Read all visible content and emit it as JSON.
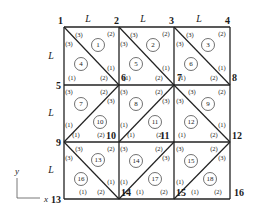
{
  "figure": {
    "grid": {
      "x0": 64,
      "y0": 27,
      "cols": [
        64,
        119,
        174,
        230
      ],
      "rows": [
        27,
        85,
        142,
        199
      ]
    },
    "nodes": [
      {
        "id": "1",
        "x": 64,
        "y": 27,
        "lx": 58,
        "ly": 24
      },
      {
        "id": "2",
        "x": 119,
        "y": 27,
        "lx": 114,
        "ly": 24
      },
      {
        "id": "3",
        "x": 174,
        "y": 27,
        "lx": 169,
        "ly": 24
      },
      {
        "id": "4",
        "x": 230,
        "y": 27,
        "lx": 225,
        "ly": 24
      },
      {
        "id": "5",
        "x": 64,
        "y": 85,
        "lx": 56,
        "ly": 89
      },
      {
        "id": "6",
        "x": 119,
        "y": 85,
        "lx": 121,
        "ly": 81
      },
      {
        "id": "7",
        "x": 174,
        "y": 85,
        "lx": 177,
        "ly": 81
      },
      {
        "id": "8",
        "x": 230,
        "y": 85,
        "lx": 232,
        "ly": 81
      },
      {
        "id": "9",
        "x": 64,
        "y": 142,
        "lx": 56,
        "ly": 146
      },
      {
        "id": "10",
        "x": 119,
        "y": 142,
        "lx": 106,
        "ly": 139
      },
      {
        "id": "11",
        "x": 174,
        "y": 142,
        "lx": 160,
        "ly": 139
      },
      {
        "id": "12",
        "x": 230,
        "y": 142,
        "lx": 232,
        "ly": 139
      },
      {
        "id": "13",
        "x": 64,
        "y": 199,
        "lx": 51,
        "ly": 203
      },
      {
        "id": "14",
        "x": 119,
        "y": 199,
        "lx": 121,
        "ly": 196
      },
      {
        "id": "15",
        "x": 174,
        "y": 199,
        "lx": 176,
        "ly": 196
      },
      {
        "id": "16",
        "x": 230,
        "y": 199,
        "lx": 234,
        "ly": 196
      }
    ],
    "dimension_labels": [
      {
        "text": "L",
        "x": 88,
        "y": 22
      },
      {
        "text": "L",
        "x": 143,
        "y": 22
      },
      {
        "text": "L",
        "x": 199,
        "y": 22
      },
      {
        "text": "L",
        "x": 51,
        "y": 59
      },
      {
        "text": "L",
        "x": 51,
        "y": 116
      },
      {
        "text": "L",
        "x": 51,
        "y": 173
      }
    ],
    "diagonals": [
      {
        "x1": 64,
        "y1": 27,
        "x2": 119,
        "y2": 85
      },
      {
        "x1": 119,
        "y1": 27,
        "x2": 174,
        "y2": 85
      },
      {
        "x1": 174,
        "y1": 27,
        "x2": 230,
        "y2": 85
      },
      {
        "x1": 64,
        "y1": 142,
        "x2": 119,
        "y2": 85
      },
      {
        "x1": 119,
        "y1": 142,
        "x2": 174,
        "y2": 85
      },
      {
        "x1": 174,
        "y1": 85,
        "x2": 230,
        "y2": 142
      },
      {
        "x1": 64,
        "y1": 142,
        "x2": 119,
        "y2": 199
      },
      {
        "x1": 119,
        "y1": 199,
        "x2": 174,
        "y2": 142
      },
      {
        "x1": 174,
        "y1": 199,
        "x2": 230,
        "y2": 142
      }
    ],
    "elements": [
      {
        "id": "1",
        "cx": 98,
        "cy": 45
      },
      {
        "id": "2",
        "cx": 153,
        "cy": 45
      },
      {
        "id": "3",
        "cx": 208,
        "cy": 45
      },
      {
        "id": "4",
        "cx": 81,
        "cy": 64
      },
      {
        "id": "5",
        "cx": 136,
        "cy": 64
      },
      {
        "id": "6",
        "cx": 191,
        "cy": 64
      },
      {
        "id": "7",
        "cx": 81,
        "cy": 104
      },
      {
        "id": "8",
        "cx": 136,
        "cy": 104
      },
      {
        "id": "9",
        "cx": 208,
        "cy": 104
      },
      {
        "id": "10",
        "cx": 100,
        "cy": 122
      },
      {
        "id": "11",
        "cx": 155,
        "cy": 122
      },
      {
        "id": "12",
        "cx": 191,
        "cy": 122
      },
      {
        "id": "13",
        "cx": 98,
        "cy": 160
      },
      {
        "id": "14",
        "cx": 136,
        "cy": 161
      },
      {
        "id": "15",
        "cx": 191,
        "cy": 161
      },
      {
        "id": "16",
        "cx": 81,
        "cy": 179
      },
      {
        "id": "17",
        "cx": 155,
        "cy": 179
      },
      {
        "id": "18",
        "cx": 210,
        "cy": 179
      }
    ],
    "local_labels": [
      {
        "t": "(3)",
        "x": 79,
        "y": 37
      },
      {
        "t": "(2)",
        "x": 111,
        "y": 36
      },
      {
        "t": "(3)",
        "x": 69,
        "y": 46
      },
      {
        "t": "(1)",
        "x": 111,
        "y": 70
      },
      {
        "t": "(1)",
        "x": 72,
        "y": 80
      },
      {
        "t": "(2)",
        "x": 104,
        "y": 80
      },
      {
        "t": "(3)",
        "x": 134,
        "y": 37
      },
      {
        "t": "(2)",
        "x": 166,
        "y": 36
      },
      {
        "t": "(3)",
        "x": 124,
        "y": 46
      },
      {
        "t": "(1)",
        "x": 166,
        "y": 70
      },
      {
        "t": "(1)",
        "x": 127,
        "y": 80
      },
      {
        "t": "(2)",
        "x": 159,
        "y": 80
      },
      {
        "t": "(3)",
        "x": 190,
        "y": 37
      },
      {
        "t": "(2)",
        "x": 222,
        "y": 36
      },
      {
        "t": "(3)",
        "x": 180,
        "y": 46
      },
      {
        "t": "(1)",
        "x": 222,
        "y": 70
      },
      {
        "t": "(1)",
        "x": 182,
        "y": 80
      },
      {
        "t": "(2)",
        "x": 214,
        "y": 80
      },
      {
        "t": "(3)",
        "x": 69,
        "y": 94
      },
      {
        "t": "(2)",
        "x": 104,
        "y": 94
      },
      {
        "t": "(3)",
        "x": 111,
        "y": 103
      },
      {
        "t": "(1)",
        "x": 69,
        "y": 127
      },
      {
        "t": "(1)",
        "x": 76,
        "y": 137
      },
      {
        "t": "(2)",
        "x": 101,
        "y": 137
      },
      {
        "t": "(3)",
        "x": 124,
        "y": 94
      },
      {
        "t": "(2)",
        "x": 159,
        "y": 94
      },
      {
        "t": "(3)",
        "x": 166,
        "y": 103
      },
      {
        "t": "(1)",
        "x": 124,
        "y": 127
      },
      {
        "t": "(1)",
        "x": 131,
        "y": 137
      },
      {
        "t": "(2)",
        "x": 160,
        "y": 137
      },
      {
        "t": "(3)",
        "x": 192,
        "y": 94
      },
      {
        "t": "(2)",
        "x": 222,
        "y": 94
      },
      {
        "t": "(3)",
        "x": 180,
        "y": 103
      },
      {
        "t": "(1)",
        "x": 222,
        "y": 127
      },
      {
        "t": "(1)",
        "x": 182,
        "y": 137
      },
      {
        "t": "(2)",
        "x": 214,
        "y": 137
      },
      {
        "t": "(3)",
        "x": 79,
        "y": 151
      },
      {
        "t": "(2)",
        "x": 111,
        "y": 151
      },
      {
        "t": "(3)",
        "x": 69,
        "y": 160
      },
      {
        "t": "(1)",
        "x": 111,
        "y": 184
      },
      {
        "t": "(1)",
        "x": 83,
        "y": 194
      },
      {
        "t": "(2)",
        "x": 101,
        "y": 194
      },
      {
        "t": "(3)",
        "x": 124,
        "y": 151
      },
      {
        "t": "(2)",
        "x": 159,
        "y": 151
      },
      {
        "t": "(3)",
        "x": 166,
        "y": 160
      },
      {
        "t": "(1)",
        "x": 124,
        "y": 184
      },
      {
        "t": "(1)",
        "x": 140,
        "y": 194
      },
      {
        "t": "(2)",
        "x": 164,
        "y": 194
      },
      {
        "t": "(3)",
        "x": 180,
        "y": 151
      },
      {
        "t": "(2)",
        "x": 214,
        "y": 151
      },
      {
        "t": "(3)",
        "x": 222,
        "y": 160
      },
      {
        "t": "(1)",
        "x": 180,
        "y": 184
      },
      {
        "t": "(1)",
        "x": 195,
        "y": 194
      },
      {
        "t": "(2)",
        "x": 218,
        "y": 194
      }
    ],
    "axes": {
      "y_label": "y",
      "x_label": "x",
      "origin_x": 17,
      "origin_y": 198,
      "y_top": 178,
      "x_right": 40,
      "y_label_x": 15,
      "y_label_y": 174,
      "x_label_x": 44,
      "x_label_y": 202
    }
  }
}
